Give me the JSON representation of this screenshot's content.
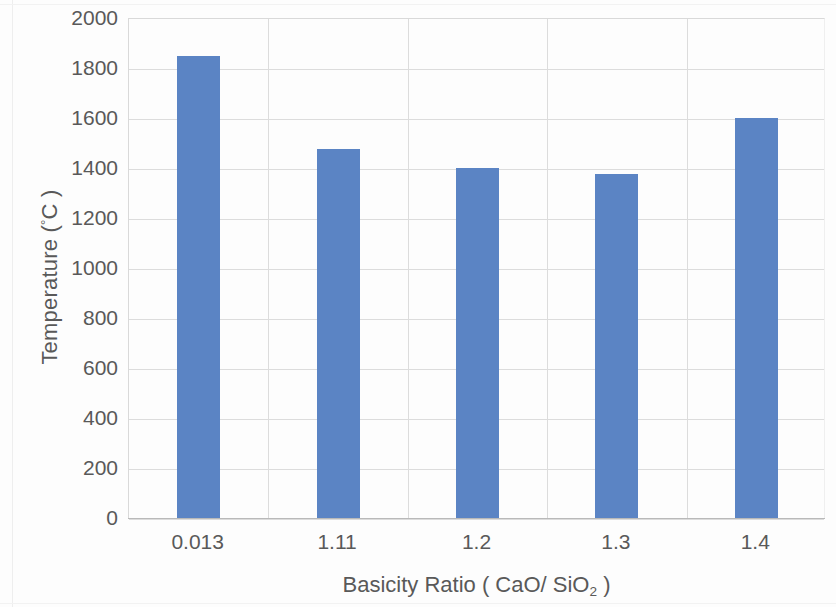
{
  "chart_data": {
    "type": "bar",
    "title": "",
    "categories": [
      "0.013",
      "1.11",
      "1.2",
      "1.3",
      "1.4"
    ],
    "values": [
      1850,
      1475,
      1400,
      1375,
      1600
    ],
    "xlabel": "Basicity Ratio ( CaO/ SiO2 )",
    "ylabel": "Temperature (°C)",
    "ylim": [
      0,
      2000
    ],
    "ytick_values": [
      0,
      200,
      400,
      600,
      800,
      1000,
      1200,
      1400,
      1600,
      1800,
      2000
    ],
    "ytick_labels": [
      "0",
      "200",
      "400",
      "600",
      "800",
      "1000",
      "1200",
      "1400",
      "1600",
      "1800",
      "2000"
    ],
    "grid": true,
    "legend": false,
    "bar_color": "#5b84c4",
    "grid_color": "#dcdcdc",
    "text_color": "#595959"
  },
  "axes": {
    "ylabel_prefix": "Temperature (",
    "ylabel_degree": "°",
    "ylabel_suffix": "C )",
    "xlabel_prefix": "Basicity Ratio ( CaO/ SiO",
    "xlabel_sub": "2",
    "xlabel_suffix": " )"
  }
}
